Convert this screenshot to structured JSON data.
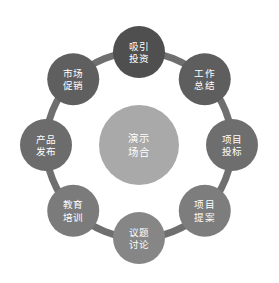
{
  "diagram": {
    "type": "cycle-ring",
    "background_color": "#ffffff",
    "ring": {
      "center_x": 139,
      "center_y": 145,
      "radius": 93,
      "stroke_width": 7,
      "stroke_color": "#6f6f6f"
    },
    "center_node": {
      "label_line1": "演示",
      "label_line2": "场合",
      "radius": 40,
      "color": "#a9a9a9",
      "text_color": "#ffffff"
    },
    "node_radius": 26,
    "nodes": [
      {
        "id": "attract-investment",
        "label_line1": "吸引",
        "label_line2": "投资",
        "angle_deg": -90,
        "color": "#4f4f4f",
        "text_color": "#ffffff",
        "highlighted": true
      },
      {
        "id": "work-summary",
        "label_line1": "工作",
        "label_line2": "总结",
        "angle_deg": -45,
        "color": "#5e5e5e",
        "text_color": "#ffffff",
        "highlighted": false
      },
      {
        "id": "project-bidding",
        "label_line1": "项目",
        "label_line2": "投标",
        "angle_deg": 0,
        "color": "#6e6e6e",
        "text_color": "#ffffff",
        "highlighted": false
      },
      {
        "id": "project-proposal",
        "label_line1": "项目",
        "label_line2": "提案",
        "angle_deg": 45,
        "color": "#7d7d7d",
        "text_color": "#ffffff",
        "highlighted": false
      },
      {
        "id": "topic-discussion",
        "label_line1": "议题",
        "label_line2": "讨论",
        "angle_deg": 90,
        "color": "#868686",
        "text_color": "#ffffff",
        "highlighted": false
      },
      {
        "id": "education-training",
        "label_line1": "教育",
        "label_line2": "培训",
        "angle_deg": 135,
        "color": "#7b7b7b",
        "text_color": "#ffffff",
        "highlighted": false
      },
      {
        "id": "product-release",
        "label_line1": "产品",
        "label_line2": "发布",
        "angle_deg": 180,
        "color": "#6c6c6c",
        "text_color": "#ffffff",
        "highlighted": false
      },
      {
        "id": "market-promotion",
        "label_line1": "市场",
        "label_line2": "促销",
        "angle_deg": -135,
        "color": "#5f5f5f",
        "text_color": "#ffffff",
        "highlighted": false
      }
    ]
  }
}
